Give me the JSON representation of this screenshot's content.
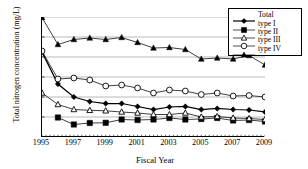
{
  "chart_data": {
    "type": "line",
    "title": "",
    "xlabel": "Fiscal Year",
    "ylabel": "Total nitrogen concentration (mg/L)",
    "xlim": [
      1995,
      2009
    ],
    "ylim": [
      0.0,
      1.2
    ],
    "yticks": [
      "0.0",
      "0.2",
      "0.4",
      "0.6",
      "0.8",
      "1.0",
      "1.2"
    ],
    "ytick_values": [
      0.0,
      0.2,
      0.4,
      0.6,
      0.8,
      1.0,
      1.2
    ],
    "xticks": [
      "1995",
      "1997",
      "1999",
      "2001",
      "2003",
      "2005",
      "2007",
      "2009"
    ],
    "xtick_values": [
      1995,
      1997,
      1999,
      2001,
      2003,
      2005,
      2007,
      2009
    ],
    "x": [
      1995,
      1996,
      1997,
      1998,
      1999,
      2000,
      2001,
      2002,
      2003,
      2004,
      2005,
      2006,
      2007,
      2008,
      2009
    ],
    "grid": "horizontal",
    "legend_position": "top-right",
    "series": [
      {
        "name": "Total",
        "marker": "filled-diamond",
        "color": "#000000",
        "values": [
          0.85,
          0.53,
          0.4,
          0.355,
          0.335,
          0.335,
          0.305,
          0.275,
          0.3,
          0.305,
          0.275,
          0.285,
          0.275,
          0.27,
          0.25
        ]
      },
      {
        "name": "type I",
        "marker": "filled-square",
        "color": "#000000",
        "values": [
          null,
          0.195,
          0.125,
          0.14,
          0.142,
          0.175,
          0.17,
          0.175,
          0.19,
          0.175,
          0.18,
          0.19,
          0.165,
          0.17,
          0.155
        ]
      },
      {
        "name": "type II",
        "marker": "open-triangle",
        "color": "#000000",
        "values": [
          0.44,
          0.325,
          0.275,
          0.267,
          0.262,
          0.25,
          0.24,
          0.225,
          0.225,
          0.24,
          0.2,
          0.205,
          0.19,
          0.185,
          0.175
        ]
      },
      {
        "name": "type III",
        "marker": "open-circle",
        "color": "#000000",
        "values": [
          0.86,
          0.58,
          0.59,
          0.57,
          0.51,
          0.52,
          0.49,
          0.44,
          0.47,
          0.46,
          0.425,
          0.44,
          0.41,
          0.415,
          0.4
        ]
      },
      {
        "name": "type IV",
        "marker": "filled-triangle",
        "color": "#000000",
        "values": [
          1.195,
          0.925,
          0.975,
          0.99,
          0.975,
          0.995,
          0.945,
          0.89,
          0.895,
          0.875,
          0.78,
          0.79,
          0.78,
          0.815,
          0.72
        ]
      }
    ]
  },
  "legend": {
    "items": [
      {
        "label": "Total",
        "marker": "filled-diamond"
      },
      {
        "label": "type I",
        "marker": "filled-square"
      },
      {
        "label": "type II",
        "marker": "open-triangle"
      },
      {
        "label": "type III",
        "marker": "open-circle"
      },
      {
        "label": "type IV",
        "marker": "filled-triangle"
      }
    ]
  }
}
